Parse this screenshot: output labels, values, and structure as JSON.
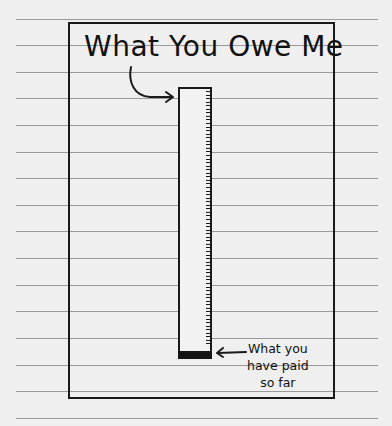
{
  "chart_data": {
    "type": "bar",
    "title": "What You Owe Me",
    "categories": [
      "What You Owe Me"
    ],
    "series": [
      {
        "name": "What you owe (total)",
        "values": [
          100
        ]
      },
      {
        "name": "What you have paid so far",
        "values": [
          3
        ]
      }
    ],
    "annotations": [
      {
        "text": "What you have paid so far",
        "points_to": "filled bottom segment of bar"
      },
      {
        "text": "What You Owe Me",
        "points_to": "top of bar"
      }
    ],
    "xlabel": "",
    "ylabel": "",
    "ylim": [
      0,
      100
    ],
    "grid": false,
    "legend": "none",
    "style": "hand-drawn cartoon on lined notebook paper"
  },
  "colors": {
    "paper": "#efefef",
    "ruled_line": "#9a9a9a",
    "ink": "#1a1a1a"
  },
  "drawing": {
    "title": "What You Owe Me",
    "annotation_lines": [
      "What you",
      "have paid",
      "so far"
    ]
  },
  "layout": {
    "bar_top_px": 87,
    "bar_bottom_px": 359,
    "paid_fill_top_px": 350,
    "ruled_lines_y": [
      19,
      45,
      72,
      98,
      125,
      152,
      178,
      205,
      231,
      258,
      285,
      311,
      338,
      365,
      391,
      418
    ],
    "tick_count": 72
  }
}
